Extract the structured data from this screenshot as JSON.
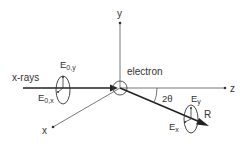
{
  "diagram": {
    "type": "x-ray scattering geometry",
    "axes": {
      "x": "x",
      "y": "y",
      "z": "z"
    },
    "labels": {
      "incident": "x-rays",
      "scatterer": "electron",
      "angle": "2θ",
      "scattered_ray": "R",
      "incident_field_y": "E",
      "incident_field_y_sub": "0,y",
      "incident_field_x": "E",
      "incident_field_x_sub": "0,x",
      "scattered_field_y": "E",
      "scattered_field_y_sub": "y",
      "scattered_field_x": "E",
      "scattered_field_x_sub": "x"
    },
    "colors": {
      "line": "#333333",
      "thin_line": "#555555",
      "background": "#ffffff"
    }
  }
}
